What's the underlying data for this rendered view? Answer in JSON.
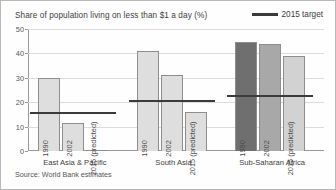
{
  "chart_data": {
    "type": "bar",
    "title": "Share of population living on less than $1 a day (%)",
    "xlabel": "",
    "ylabel": "",
    "ylim": [
      0,
      50
    ],
    "yticks": [
      0,
      10,
      20,
      30,
      40,
      50
    ],
    "grid": true,
    "legend_position": "top-right",
    "legend": [
      {
        "name": "2015 target",
        "marker": "line",
        "color": "#3b3b3b"
      }
    ],
    "series": [
      {
        "name": "1990",
        "values": [
          30,
          41,
          44.5
        ]
      },
      {
        "name": "2002",
        "values": [
          11.5,
          31,
          44
        ]
      },
      {
        "name": "2015 (predicted)",
        "values": [
          0.5,
          16,
          39
        ]
      }
    ],
    "categories": [
      "East Asia & Pacific",
      "South Asia",
      "Sub-Saharan Africa"
    ],
    "annotations": [
      {
        "label": "2015 target",
        "category": "East Asia & Pacific",
        "value": 15.5
      },
      {
        "label": "2015 target",
        "category": "South Asia",
        "value": 20.5
      },
      {
        "label": "2015 target",
        "category": "Sub-Saharan Africa",
        "value": 22.5
      }
    ],
    "source": "Source: World Bank estimates"
  },
  "header": {
    "title": "Share of population living on less than $1 a day (%)",
    "legend_label": "2015 target"
  },
  "axis": {
    "y_ticks": [
      "50",
      "40",
      "30",
      "20",
      "10",
      "0"
    ]
  },
  "groups": [
    {
      "label": "East Asia & Pacific",
      "target": 15.5,
      "bars": [
        {
          "caption": "1990",
          "value": 30,
          "color": "#dedede"
        },
        {
          "caption": "2002",
          "value": 11.5,
          "color": "#dedede"
        },
        {
          "caption": "2015 (predicted)",
          "value": 0.5,
          "color": "#dedede"
        }
      ]
    },
    {
      "label": "South Asia",
      "target": 20.5,
      "bars": [
        {
          "caption": "1990",
          "value": 41,
          "color": "#dedede"
        },
        {
          "caption": "2002",
          "value": 31,
          "color": "#dedede"
        },
        {
          "caption": "2015 (predicted)",
          "value": 16,
          "color": "#dedede"
        }
      ]
    },
    {
      "label": "Sub-Saharan Africa",
      "target": 22.5,
      "bars": [
        {
          "caption": "1990",
          "value": 44.5,
          "color": "#6f6f6f"
        },
        {
          "caption": "2002",
          "value": 44,
          "color": "#a8a8a8"
        },
        {
          "caption": "2015 (predicted)",
          "value": 39,
          "color": "#d2d2d2"
        }
      ]
    }
  ],
  "footer": {
    "source": "Source: World Bank estimates"
  }
}
